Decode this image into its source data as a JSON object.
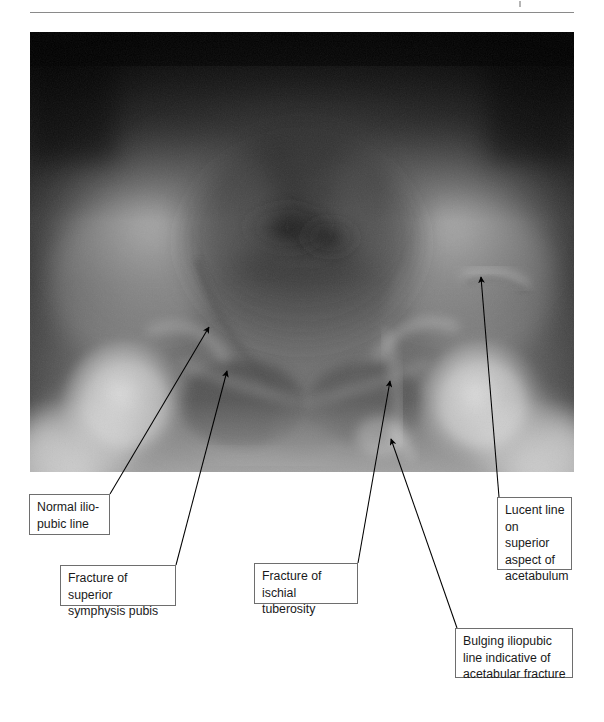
{
  "figure": {
    "type": "annotated-radiograph",
    "modality": "plain radiograph",
    "view": "AP pelvis",
    "rule_present": true
  },
  "xray": {
    "alt": "AP pelvis radiograph showing pelvic ring and acetabular fractures",
    "frame": {
      "x": 30,
      "y": 32,
      "w": 544,
      "h": 440
    }
  },
  "annotations": [
    {
      "id": "normal-iliopubic-line",
      "text": "Normal ilio-\npubic line",
      "box": {
        "x": 29,
        "y": 494,
        "w": 81,
        "h": 41
      },
      "arrow": {
        "x1": 110,
        "y1": 494,
        "x2": 209,
        "y2": 327
      }
    },
    {
      "id": "fracture-superior-symphysis-pubis",
      "text": "Fracture of superior\nsymphysis pubis",
      "box": {
        "x": 60,
        "y": 565,
        "w": 116,
        "h": 41
      },
      "arrow": {
        "x1": 176,
        "y1": 565,
        "x2": 227,
        "y2": 371
      }
    },
    {
      "id": "fracture-ischial-tuberosity",
      "text": "Fracture of\nischial tuberosity",
      "box": {
        "x": 254,
        "y": 563,
        "w": 104,
        "h": 41
      },
      "arrow": {
        "x1": 358,
        "y1": 563,
        "x2": 390,
        "y2": 381
      }
    },
    {
      "id": "lucent-line-superior-acetabulum",
      "text": "Lucent line\non superior\naspect of\nacetabulum",
      "box": {
        "x": 497,
        "y": 497,
        "w": 75,
        "h": 73
      },
      "arrow": {
        "x1": 499,
        "y1": 497,
        "x2": 481,
        "y2": 277
      }
    },
    {
      "id": "bulging-iliopubic-line",
      "text": "Bulging iliopubic\nline indicative of\nacetabular fracture",
      "box": {
        "x": 455,
        "y": 628,
        "w": 118,
        "h": 50
      },
      "arrow": {
        "x1": 457,
        "y1": 628,
        "x2": 391,
        "y2": 439
      }
    }
  ],
  "colors": {
    "box_border": "#6e6e6e",
    "text": "#1a1a1a",
    "arrow": "#000000",
    "rule": "#8a8a8a",
    "page_background": "#ffffff"
  }
}
